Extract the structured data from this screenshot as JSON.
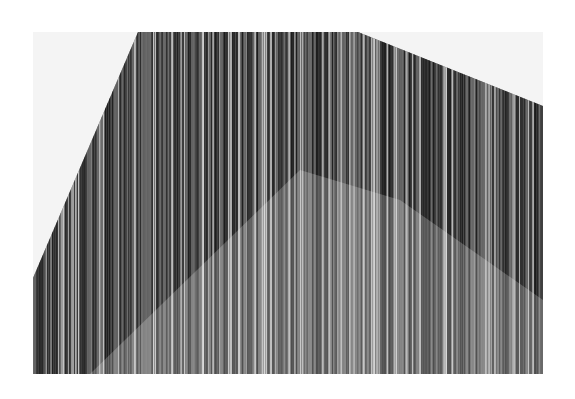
{
  "artwork": {
    "description": "Drawing of dense vertical ink lines filling an irregular polygon on a light sheet",
    "colors": {
      "page": "#ffffff",
      "sheet": "#f4f4f4",
      "ink_dark": "#1a1a1a",
      "ink_mid": "#6e6e6e",
      "highlight": "#cfcfcf"
    },
    "sheet_rect": {
      "x": 33,
      "y": 32,
      "width": 510,
      "height": 342
    },
    "polygon_points": [
      [
        138,
        32
      ],
      [
        358,
        32
      ],
      [
        543,
        106
      ],
      [
        543,
        374
      ],
      [
        33,
        374
      ],
      [
        33,
        278
      ]
    ],
    "light_region_points": [
      [
        90,
        374
      ],
      [
        300,
        170
      ],
      [
        400,
        200
      ],
      [
        543,
        300
      ],
      [
        543,
        374
      ]
    ]
  }
}
